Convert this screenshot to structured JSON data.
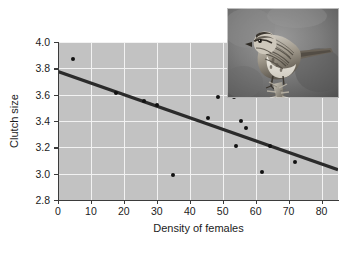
{
  "figure": {
    "name": "clutch-size-vs-density-scatterplot",
    "background_color": "#ffffff",
    "panel_color": "#c2c2c2",
    "gridline_color": "#f2f2f2",
    "axis_color": "#3b3b3b",
    "point_color": "#111111",
    "line_color": "#2b2b2b"
  },
  "inset": {
    "name": "song-sparrow-photo",
    "caption": "",
    "description": "grayscale photograph of a song sparrow perched on a dried plant stalk"
  },
  "chart_data": {
    "type": "scatter",
    "title": "",
    "subtitle": "",
    "xlabel": "Density of females",
    "ylabel": "Clutch size",
    "xlim": [
      0,
      85
    ],
    "ylim": [
      2.8,
      4.0
    ],
    "xticks": [
      0,
      10,
      20,
      30,
      40,
      50,
      60,
      70,
      80
    ],
    "xtick_labels": [
      "0",
      "10",
      "20",
      "30",
      "40",
      "50",
      "60",
      "70",
      "80"
    ],
    "yticks": [
      2.8,
      3.0,
      3.2,
      3.4,
      3.6,
      3.8,
      4.0
    ],
    "ytick_labels": [
      "2.8",
      "3.0",
      "3.2",
      "3.4",
      "3.6",
      "3.8",
      "4.0"
    ],
    "grid": true,
    "grid_color": "#f2f2f2",
    "legend": null,
    "legend_position": "none",
    "x": [
      4.5,
      17.5,
      26.0,
      30.0,
      35.0,
      45.5,
      48.5,
      53.5,
      54.0,
      55.5,
      57.0,
      62.0,
      64.5,
      72.0
    ],
    "y": [
      3.87,
      3.61,
      3.55,
      3.52,
      2.99,
      3.42,
      3.58,
      3.58,
      3.21,
      3.4,
      3.345,
      3.015,
      3.21,
      3.085
    ],
    "points": [
      {
        "x": 4.5,
        "y": 3.87
      },
      {
        "x": 17.5,
        "y": 3.61
      },
      {
        "x": 26.0,
        "y": 3.55
      },
      {
        "x": 30.0,
        "y": 3.52
      },
      {
        "x": 35.0,
        "y": 2.99
      },
      {
        "x": 45.5,
        "y": 3.42
      },
      {
        "x": 48.5,
        "y": 3.58
      },
      {
        "x": 53.5,
        "y": 3.58
      },
      {
        "x": 54.0,
        "y": 3.21
      },
      {
        "x": 55.5,
        "y": 3.4
      },
      {
        "x": 57.0,
        "y": 3.345
      },
      {
        "x": 62.0,
        "y": 3.015
      },
      {
        "x": 64.5,
        "y": 3.21
      },
      {
        "x": 72.0,
        "y": 3.085
      }
    ],
    "trendline": {
      "type": "linear",
      "x_start": 0,
      "y_start": 3.775,
      "x_end": 85,
      "y_end": 3.03
    }
  }
}
